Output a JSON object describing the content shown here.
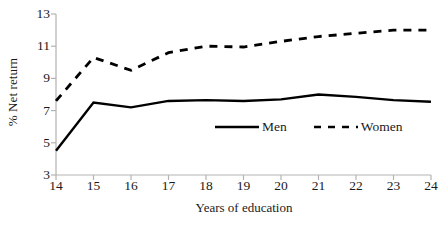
{
  "chart_data": {
    "type": "line",
    "title": "",
    "subtitle": "",
    "xlabel": "Years of education",
    "ylabel": "% Net return",
    "x": [
      14,
      15,
      16,
      17,
      18,
      19,
      20,
      21,
      22,
      23,
      24
    ],
    "xtick_labels": [
      "14",
      "15",
      "16",
      "17",
      "18",
      "19",
      "20",
      "21",
      "22",
      "23",
      "24"
    ],
    "ytick_labels": [
      "3",
      "5",
      "7",
      "9",
      "11",
      "13"
    ],
    "ytick_values": [
      3,
      5,
      7,
      9,
      11,
      13
    ],
    "xlim": [
      14,
      24
    ],
    "ylim": [
      3,
      13
    ],
    "grid": false,
    "legend_position": "inside-lower-right",
    "series": [
      {
        "name": "Men",
        "style": "solid",
        "color": "#000000",
        "values": [
          4.5,
          7.5,
          7.2,
          7.6,
          7.65,
          7.6,
          7.7,
          8.0,
          7.85,
          7.65,
          7.55
        ]
      },
      {
        "name": "Women",
        "style": "dashed",
        "color": "#000000",
        "values": [
          7.6,
          10.3,
          9.5,
          10.6,
          11.0,
          10.95,
          11.3,
          11.6,
          11.8,
          12.0,
          12.0
        ]
      }
    ],
    "annotations": []
  },
  "legend": {
    "men_label": "Men",
    "women_label": "Women"
  },
  "axes": {
    "axis_color": "#b3b3b3",
    "tick_color": "#b3b3b3"
  }
}
